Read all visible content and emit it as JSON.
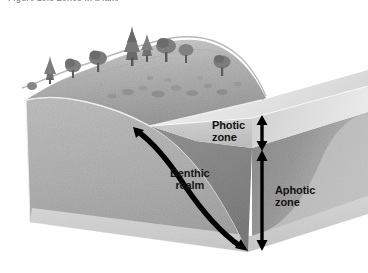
{
  "figure": {
    "caption": "Figure 10.5  Zones in a lake",
    "alt": "Cutaway block diagram of a lake showing photic zone, aphotic zone and benthic realm"
  },
  "labels": {
    "photic_zone": "Photic\nzone",
    "aphotic_zone": "Aphotic\nzone",
    "benthic_realm": "Benthic\nrealm"
  },
  "colors": {
    "page_background": "#ffffff",
    "caption_text": "#3c3c3c",
    "label_text": "#111111",
    "arrow": "#000000",
    "hillside_grass": "#b9b9b9",
    "hillside_grass_dark": "#9d9d9d",
    "soil_cross_section": "#b4b4b4",
    "soil_cross_section_shadow": "#a2a2a2",
    "water_surface": "#e6e6e6",
    "photic_water": "#c8c8c8",
    "aphotic_water": "#8a8a8a",
    "aphotic_water_dark": "#7b7b7b",
    "lake_bed_base": "#d8d8d8",
    "tree_foliage": "#7a7a7a",
    "rock": "#8f8f8f"
  },
  "scene": {
    "terrain_features": [
      "conifer-trees",
      "deciduous-trees",
      "grassy-hillside",
      "scattered-rocks"
    ],
    "water_zones": [
      "photic",
      "aphotic"
    ],
    "measurement_arrows": [
      {
        "name": "photic-zone-depth-arrow",
        "double_headed": true,
        "orientation": "vertical"
      },
      {
        "name": "aphotic-zone-depth-arrow",
        "double_headed": true,
        "orientation": "vertical"
      }
    ],
    "benthic_arrow": {
      "name": "benthic-realm-arrow",
      "double_headed": true,
      "orientation": "curved"
    }
  }
}
